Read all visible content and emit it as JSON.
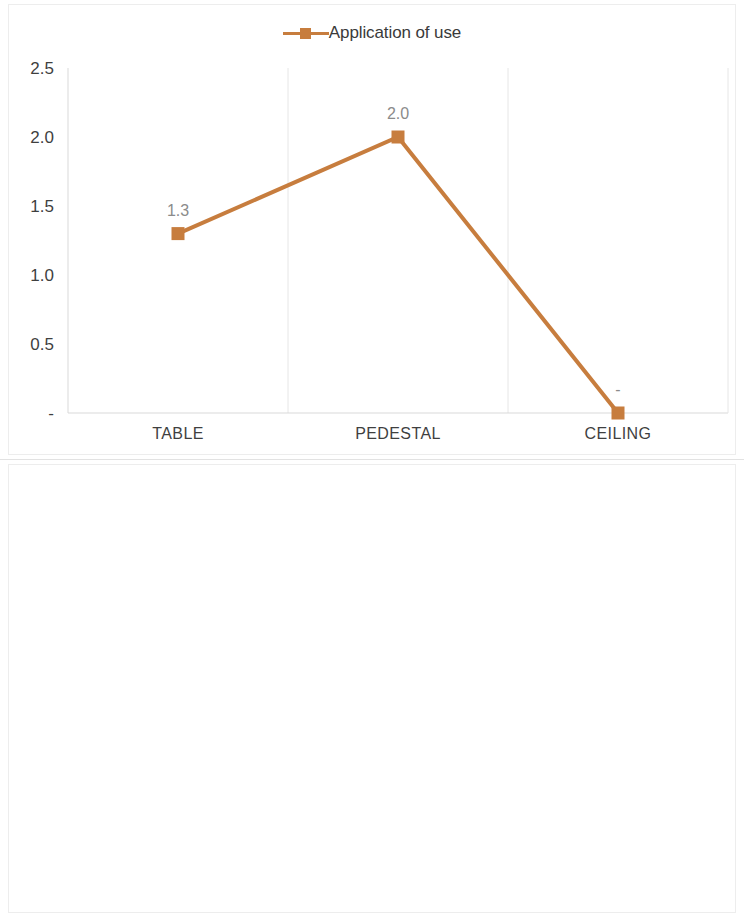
{
  "panels": [
    {
      "id": "top",
      "legend_label": "Application of use",
      "color": "#C77D3E"
    },
    {
      "id": "bottom",
      "legend_label": "Color",
      "color": "#F4A650"
    }
  ],
  "chart_data": [
    {
      "type": "line",
      "title": "Application of use",
      "xlabel": "",
      "ylabel": "",
      "categories": [
        "TABLE",
        "PEDESTAL",
        "CEILING"
      ],
      "series": [
        {
          "name": "Application of use",
          "values": [
            1.3,
            2.0,
            0.0
          ],
          "color": "#C77D3E"
        }
      ],
      "data_labels": [
        "1.3",
        "2.0",
        "-"
      ],
      "ytick_labels": [
        "2.5",
        "2.0",
        "1.5",
        "1.0",
        "0.5",
        "-"
      ],
      "ytick_values": [
        2.5,
        2.0,
        1.5,
        1.0,
        0.5,
        0.0
      ],
      "ylim": [
        0,
        2.5
      ],
      "grid": "vertical",
      "legend_position": "top-center",
      "marker": "square"
    },
    {
      "type": "line",
      "title": "Color",
      "xlabel": "",
      "ylabel": "",
      "categories": [
        "WITE",
        "BLACK"
      ],
      "series": [
        {
          "name": "Color",
          "values": [
            2.0,
            0.0
          ],
          "color": "#F4A650"
        }
      ],
      "data_labels": [
        "2.0",
        "-"
      ],
      "ytick_labels": [
        "2.5",
        "2.0",
        "1.5",
        "1.0",
        "0.5",
        "-"
      ],
      "ytick_values": [
        2.5,
        2.0,
        1.5,
        1.0,
        0.5,
        0.0
      ],
      "ylim": [
        0,
        2.5
      ],
      "grid": "vertical",
      "legend_position": "top-center",
      "marker": "square"
    }
  ]
}
